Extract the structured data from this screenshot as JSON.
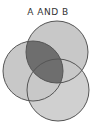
{
  "title": "A AND B",
  "diagram": {
    "type": "venn",
    "sets": [
      {
        "name": "A",
        "cx": 33,
        "cy": 71,
        "r": 30
      },
      {
        "name": "B",
        "cx": 57,
        "cy": 52,
        "r": 31
      },
      {
        "name": "C",
        "cx": 58,
        "cy": 90,
        "r": 31
      }
    ],
    "highlighted_region": "A ∩ B",
    "colors": {
      "circle_fill": "#c8c8c8",
      "highlight_fill": "#6e6e6e",
      "stroke": "#555555",
      "background": "#ffffff"
    }
  }
}
